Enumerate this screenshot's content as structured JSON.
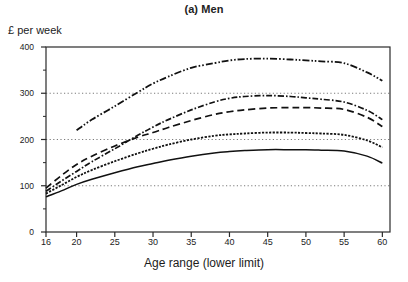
{
  "chart_data": {
    "type": "line",
    "title": "(a) Men",
    "xlabel": "Age range (lower limit)",
    "ylabel": "£ per week",
    "xlim": [
      16,
      61
    ],
    "ylim": [
      0,
      400
    ],
    "yticks": [
      0,
      100,
      200,
      300,
      400
    ],
    "xticks": [
      16,
      20,
      25,
      30,
      35,
      40,
      45,
      50,
      55,
      60
    ],
    "xtick_labels": [
      "16",
      "20",
      "25",
      "30",
      "35",
      "40",
      "45",
      "50",
      "55",
      "60"
    ],
    "ytick_labels": [
      "0",
      "100",
      "200",
      "300",
      "400"
    ],
    "grid": "horizontal-dotted at 100, 200, 300",
    "legend": "none",
    "x": [
      16,
      18,
      20,
      22,
      25,
      28,
      30,
      32,
      35,
      38,
      40,
      42,
      45,
      48,
      50,
      52,
      55,
      58,
      60
    ],
    "series": [
      {
        "name": "series-1",
        "style": "dash-dot-dot",
        "x": [
          20,
          22,
          25,
          28,
          30,
          32,
          35,
          38,
          40,
          42,
          45,
          48,
          50,
          52,
          55,
          58,
          60
        ],
        "values": [
          220,
          243,
          272,
          302,
          321,
          336,
          355,
          365,
          371,
          374,
          375,
          373,
          371,
          369,
          365,
          345,
          327
        ]
      },
      {
        "name": "series-2",
        "style": "dash-dot",
        "x": [
          16,
          18,
          20,
          22,
          25,
          28,
          30,
          32,
          35,
          38,
          40,
          42,
          45,
          48,
          50,
          52,
          55,
          58,
          60
        ],
        "values": [
          88,
          110,
          131,
          152,
          180,
          209,
          227,
          243,
          264,
          281,
          289,
          293,
          295,
          293,
          290,
          287,
          281,
          263,
          243
        ]
      },
      {
        "name": "series-3",
        "style": "long-dash",
        "x": [
          16,
          18,
          20,
          22,
          25,
          28,
          30,
          32,
          35,
          38,
          40,
          42,
          45,
          48,
          50,
          52,
          55,
          58,
          60
        ],
        "values": [
          95,
          122,
          146,
          164,
          186,
          205,
          215,
          226,
          241,
          254,
          260,
          264,
          268,
          269,
          269,
          268,
          265,
          248,
          228
        ]
      },
      {
        "name": "series-4",
        "style": "dense-dash-dotted",
        "x": [
          16,
          18,
          20,
          22,
          25,
          28,
          30,
          32,
          35,
          38,
          40,
          42,
          45,
          48,
          50,
          52,
          55,
          58,
          60
        ],
        "values": [
          83,
          101,
          119,
          134,
          153,
          170,
          180,
          189,
          200,
          208,
          211,
          213,
          215,
          215,
          214,
          213,
          210,
          198,
          183
        ]
      },
      {
        "name": "series-5",
        "style": "solid",
        "x": [
          16,
          18,
          20,
          22,
          25,
          28,
          30,
          32,
          35,
          38,
          40,
          42,
          45,
          48,
          50,
          52,
          55,
          58,
          60
        ],
        "values": [
          76,
          89,
          103,
          114,
          128,
          141,
          148,
          155,
          164,
          171,
          174,
          176,
          178,
          178,
          178,
          177,
          175,
          164,
          149
        ]
      }
    ]
  }
}
